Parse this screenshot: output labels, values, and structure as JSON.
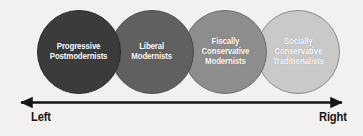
{
  "figure": {
    "background_color": "#f3f1ef",
    "groups": [
      {
        "id": "progressive-postmodernists",
        "label": "Progressive\nPostmodernists",
        "fill_color": "#3b3b3b",
        "stroke_color": "#2a2a2a",
        "text_color": "#ffffff",
        "position": "far-left"
      },
      {
        "id": "liberal-modernists",
        "label": "Liberal\nModernists",
        "fill_color": "#606060",
        "stroke_color": "#4a4a4a",
        "text_color": "#ffffff",
        "position": "center-left"
      },
      {
        "id": "fiscally-conservative-modernists",
        "label": "Fiscally\nConservative\nModernists",
        "fill_color": "#8d8d8d",
        "stroke_color": "#6d6d6d",
        "text_color": "#ffffff",
        "position": "center-right"
      },
      {
        "id": "socially-conservative-traditionalists",
        "label": "Socially\nConservative\nTraditionalists",
        "fill_color": "#c9c9c9",
        "stroke_color": "#8a8a8a",
        "text_color": "#ffffff",
        "position": "far-right"
      }
    ],
    "axis": {
      "left_label": "Left",
      "right_label": "Right",
      "line_color": "#161616",
      "style": "double-headed-arrow"
    }
  }
}
